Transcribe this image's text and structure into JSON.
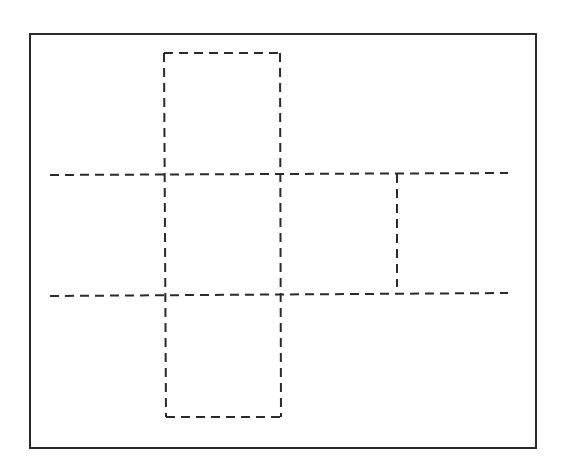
{
  "diagram": {
    "colors": {
      "stroke": "#2a2a2a",
      "background": "#ffffff"
    },
    "frame": {
      "x": 30,
      "y": 34,
      "width": 506,
      "height": 414
    },
    "dash_pattern": "9,6",
    "lines": [
      {
        "id": "top-square-top",
        "x1": 164,
        "y1": 53,
        "x2": 280,
        "y2": 53
      },
      {
        "id": "left-vertical",
        "x1": 164,
        "y1": 53,
        "x2": 166,
        "y2": 417
      },
      {
        "id": "right-vertical",
        "x1": 280,
        "y1": 53,
        "x2": 281,
        "y2": 417
      },
      {
        "id": "upper-horizontal",
        "x1": 50,
        "y1": 175,
        "x2": 508,
        "y2": 173
      },
      {
        "id": "lower-horizontal",
        "x1": 50,
        "y1": 296,
        "x2": 508,
        "y2": 293
      },
      {
        "id": "right-square-vertical",
        "x1": 397,
        "y1": 174,
        "x2": 397,
        "y2": 287
      },
      {
        "id": "bottom-square-bottom",
        "x1": 166,
        "y1": 417,
        "x2": 281,
        "y2": 417
      }
    ]
  }
}
